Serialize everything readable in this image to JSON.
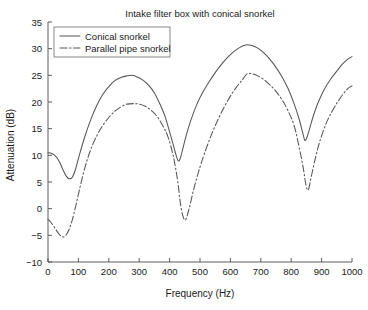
{
  "chart_data": {
    "type": "line",
    "title": "Intake filter box with conical snorkel",
    "xlabel": "Frequency (Hz)",
    "ylabel": "Attenuation (dB)",
    "xlim": [
      0,
      1000
    ],
    "ylim": [
      -10,
      35
    ],
    "xticks": [
      0,
      100,
      200,
      300,
      400,
      500,
      600,
      700,
      800,
      900,
      1000
    ],
    "yticks": [
      -10,
      -5,
      0,
      5,
      10,
      15,
      20,
      25,
      30,
      35
    ],
    "xtick_labels": [
      "0",
      "100",
      "200",
      "300",
      "400",
      "500",
      "600",
      "700",
      "800",
      "900",
      "1000"
    ],
    "ytick_labels": [
      "-10",
      "-5",
      "0",
      "5",
      "10",
      "15",
      "20",
      "25",
      "30",
      "35"
    ],
    "grid": false,
    "legend_position": "upper left",
    "series": [
      {
        "name": "Conical snorkel",
        "style": "solid",
        "color": "#555555",
        "x": [
          0,
          10,
          20,
          30,
          40,
          50,
          60,
          70,
          80,
          90,
          100,
          120,
          140,
          160,
          180,
          200,
          220,
          240,
          260,
          275,
          290,
          310,
          330,
          350,
          370,
          385,
          400,
          410,
          420,
          428,
          435,
          445,
          455,
          470,
          490,
          510,
          530,
          550,
          570,
          590,
          610,
          630,
          650,
          670,
          690,
          710,
          730,
          750,
          770,
          790,
          810,
          825,
          838,
          845,
          852,
          862,
          875,
          890,
          910,
          930,
          950,
          970,
          985,
          1000
        ],
        "y": [
          10.5,
          10.4,
          10.1,
          9.5,
          8.5,
          7.2,
          6.1,
          5.6,
          5.9,
          7.3,
          9.4,
          13.3,
          16.6,
          19.3,
          21.4,
          22.9,
          24.0,
          24.6,
          24.9,
          25.0,
          24.8,
          24.2,
          23.2,
          21.7,
          19.4,
          17.3,
          14.4,
          12.4,
          10.3,
          9.0,
          9.4,
          11.6,
          13.8,
          16.6,
          19.6,
          21.9,
          23.8,
          25.5,
          27.0,
          28.3,
          29.4,
          30.2,
          30.7,
          30.6,
          30.1,
          29.2,
          28.0,
          26.5,
          24.7,
          22.5,
          19.6,
          17.0,
          14.2,
          12.8,
          13.4,
          15.3,
          17.8,
          20.1,
          22.5,
          24.3,
          25.8,
          27.2,
          28.0,
          28.5
        ]
      },
      {
        "name": "Parallel pipe snorkel",
        "style": "dashdot",
        "color": "#555555",
        "x": [
          0,
          10,
          20,
          30,
          40,
          50,
          60,
          70,
          80,
          90,
          100,
          120,
          140,
          160,
          180,
          200,
          220,
          240,
          260,
          280,
          300,
          320,
          340,
          360,
          380,
          395,
          410,
          420,
          428,
          434,
          442,
          452,
          465,
          480,
          500,
          520,
          540,
          560,
          580,
          600,
          620,
          640,
          655,
          670,
          690,
          710,
          730,
          750,
          770,
          790,
          810,
          828,
          840,
          848,
          856,
          866,
          880,
          895,
          915,
          935,
          955,
          975,
          990,
          1000
        ],
        "y": [
          -2.0,
          -2.6,
          -3.4,
          -4.3,
          -5.0,
          -5.3,
          -4.9,
          -3.8,
          -2.1,
          0.2,
          2.7,
          7.4,
          11.0,
          13.6,
          15.6,
          17.1,
          18.3,
          19.1,
          19.6,
          19.7,
          19.6,
          19.2,
          18.4,
          17.2,
          15.3,
          13.4,
          10.4,
          7.5,
          4.6,
          1.6,
          -1.0,
          -2.1,
          0.2,
          3.8,
          7.8,
          11.2,
          14.2,
          16.8,
          19.1,
          21.1,
          22.8,
          24.2,
          25.3,
          25.3,
          24.9,
          24.2,
          23.2,
          22.0,
          20.4,
          18.3,
          15.5,
          11.0,
          7.5,
          4.6,
          3.5,
          6.0,
          9.6,
          12.8,
          16.0,
          18.3,
          20.2,
          21.8,
          22.7,
          23.0
        ]
      }
    ]
  },
  "legend": {
    "entries": [
      {
        "label": "Conical snorkel",
        "style": "solid"
      },
      {
        "label": "Parallel pipe snorkel",
        "style": "dashdot"
      }
    ]
  }
}
